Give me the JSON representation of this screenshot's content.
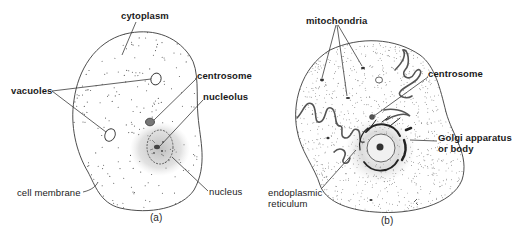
{
  "figure": {
    "panel_a": {
      "caption": "(a)",
      "labels": {
        "cytoplasm": "cytoplasm",
        "vacuoles": "vacuoles",
        "centrosome": "centrosome",
        "nucleolus": "nucleolus",
        "cell_membrane": "cell membrane",
        "nucleus": "nucleus"
      }
    },
    "panel_b": {
      "caption": "(b)",
      "labels": {
        "mitochondria": "mitochondria",
        "centrosome": "centrosome",
        "golgi_line1": "Golgi apparatus",
        "golgi_line2": "or body",
        "er_line1": "endoplasmic",
        "er_line2": "reticulum"
      }
    },
    "colors": {
      "ink": "#2b2b2b",
      "stipple": "#555555",
      "halo": "#9a9a9a",
      "background": "#ffffff"
    }
  }
}
